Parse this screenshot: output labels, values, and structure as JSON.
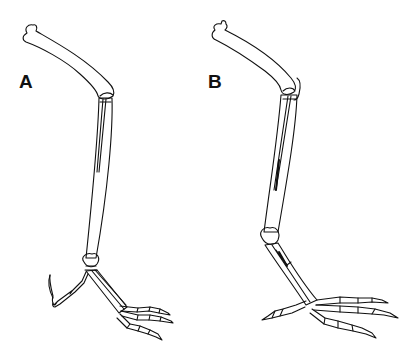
{
  "figure": {
    "panels": [
      {
        "label": "A",
        "subject": "bird-leg-skeleton",
        "feature": "reversed-hallux-hooked-claw"
      },
      {
        "label": "B",
        "subject": "bird-leg-skeleton",
        "feature": "anisodactyl-foot"
      }
    ],
    "colors": {
      "ink": "#111111",
      "background": "#ffffff"
    }
  }
}
